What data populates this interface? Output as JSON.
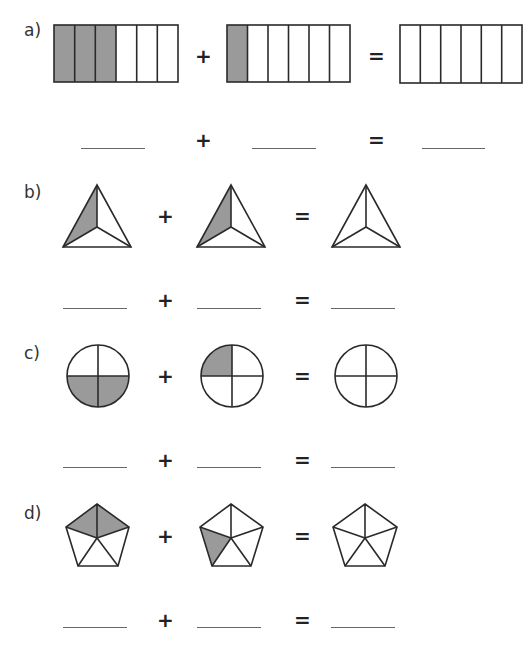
{
  "worksheet": {
    "shade_color": "#9a9a9a",
    "stroke_color": "#2a2a2a",
    "operators": {
      "plus": "+",
      "equals": "="
    },
    "problems": [
      {
        "label": "a)",
        "shape": "rectangle-6-strips",
        "figures": [
          {
            "parts": 6,
            "shaded": 3
          },
          {
            "parts": 6,
            "shaded": 1
          },
          {
            "parts": 6,
            "shaded": 0
          }
        ],
        "answers": [
          "",
          "",
          ""
        ]
      },
      {
        "label": "b)",
        "shape": "triangle-3-sectors",
        "figures": [
          {
            "parts": 3,
            "shaded": 1
          },
          {
            "parts": 3,
            "shaded": 1
          },
          {
            "parts": 3,
            "shaded": 0
          }
        ],
        "answers": [
          "",
          "",
          ""
        ]
      },
      {
        "label": "c)",
        "shape": "circle-4-quarters",
        "figures": [
          {
            "parts": 4,
            "shaded": 2
          },
          {
            "parts": 4,
            "shaded": 1
          },
          {
            "parts": 4,
            "shaded": 0
          }
        ],
        "answers": [
          "",
          "",
          ""
        ]
      },
      {
        "label": "d)",
        "shape": "pentagon-5-sectors",
        "figures": [
          {
            "parts": 5,
            "shaded": 2
          },
          {
            "parts": 5,
            "shaded": 1
          },
          {
            "parts": 5,
            "shaded": 0
          }
        ],
        "answers": [
          "",
          "",
          ""
        ]
      }
    ]
  }
}
